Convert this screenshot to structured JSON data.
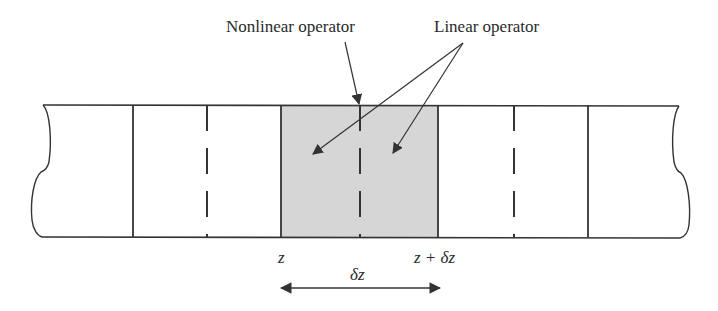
{
  "diagram": {
    "labels": {
      "nonlinear_operator": "Nonlinear operator",
      "linear_operator": "Linear operator",
      "z_start": "z",
      "z_end": "z + δz",
      "step": "δz"
    },
    "colors": {
      "line": "#333333",
      "shaded_segment": "#d6d6d6",
      "background": "#ffffff",
      "text": "#2a2a2a"
    },
    "segments": [
      {
        "id": "segment-1",
        "shaded": false,
        "has_midline": true
      },
      {
        "id": "segment-2-step",
        "shaded": true,
        "has_midline": true
      },
      {
        "id": "segment-3",
        "shaded": false,
        "has_midline": true
      }
    ]
  }
}
